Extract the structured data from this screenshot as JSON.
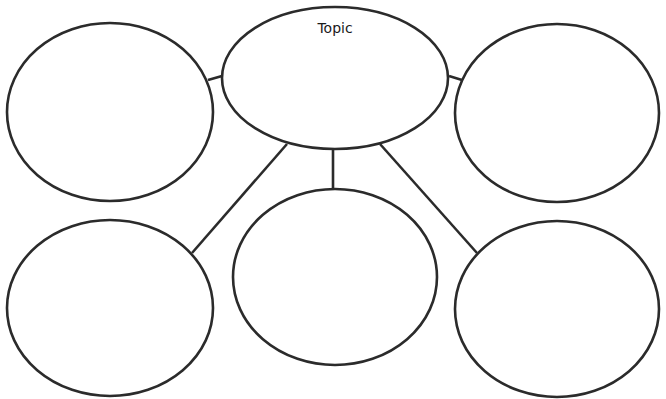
{
  "diagram": {
    "type": "bubble-map",
    "center": {
      "label": "Topic",
      "cx": 335,
      "cy": 78,
      "rx": 113,
      "ry": 71
    },
    "bubbles": [
      {
        "id": "top-left",
        "label": "",
        "cx": 110,
        "cy": 112,
        "rx": 103,
        "ry": 89
      },
      {
        "id": "top-right",
        "label": "",
        "cx": 557,
        "cy": 113,
        "rx": 102,
        "ry": 89
      },
      {
        "id": "bottom-left",
        "label": "",
        "cx": 110,
        "cy": 308,
        "rx": 103,
        "ry": 88
      },
      {
        "id": "bottom-middle",
        "label": "",
        "cx": 335,
        "cy": 277,
        "rx": 102,
        "ry": 88
      },
      {
        "id": "bottom-right",
        "label": "",
        "cx": 557,
        "cy": 309,
        "rx": 102,
        "ry": 88
      }
    ],
    "connectors": [
      {
        "to": "top-left",
        "x1": 222,
        "y1": 76,
        "x2": 208,
        "y2": 80
      },
      {
        "to": "top-right",
        "x1": 449,
        "y1": 76,
        "x2": 462,
        "y2": 80
      },
      {
        "to": "bottom-left",
        "x1": 287,
        "y1": 144,
        "x2": 192,
        "y2": 253
      },
      {
        "to": "bottom-middle",
        "x1": 333,
        "y1": 149,
        "x2": 333,
        "y2": 189
      },
      {
        "to": "bottom-right",
        "x1": 380,
        "y1": 144,
        "x2": 477,
        "y2": 253
      }
    ],
    "colors": {
      "stroke": "#2b2b2b",
      "fill": "#ffffff",
      "background": "#ffffff"
    }
  }
}
